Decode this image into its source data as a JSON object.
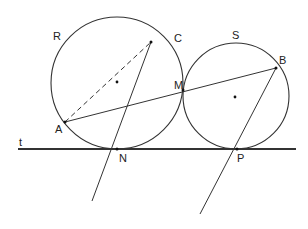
{
  "diagram": {
    "type": "geometry",
    "colors": {
      "stroke": "#333333",
      "label": "#222222",
      "background": "#ffffff"
    },
    "circles": {
      "R": {
        "label": "R",
        "cx": 117,
        "cy": 83,
        "r": 66
      },
      "S": {
        "label": "S",
        "cx": 236,
        "cy": 96,
        "r": 53
      }
    },
    "tangent_line": {
      "label": "t",
      "x1": 18,
      "y1": 149,
      "x2": 296,
      "y2": 149
    },
    "points": {
      "A": {
        "label": "A",
        "x": 65,
        "y": 122
      },
      "B": {
        "label": "B",
        "x": 276,
        "y": 68
      },
      "C": {
        "label": "C",
        "x": 151,
        "y": 42
      },
      "M": {
        "label": "M",
        "x": 183,
        "y": 90
      },
      "N": {
        "label": "N",
        "x": 117,
        "y": 149
      },
      "P": {
        "label": "P",
        "x": 237,
        "y": 149
      }
    },
    "segments": [
      {
        "name": "AC",
        "style": "dashed"
      },
      {
        "name": "AB",
        "style": "solid"
      },
      {
        "name": "CN-extended",
        "style": "solid"
      },
      {
        "name": "BP-extended",
        "style": "solid"
      }
    ],
    "center_marks": [
      "R-center",
      "S-center"
    ]
  }
}
